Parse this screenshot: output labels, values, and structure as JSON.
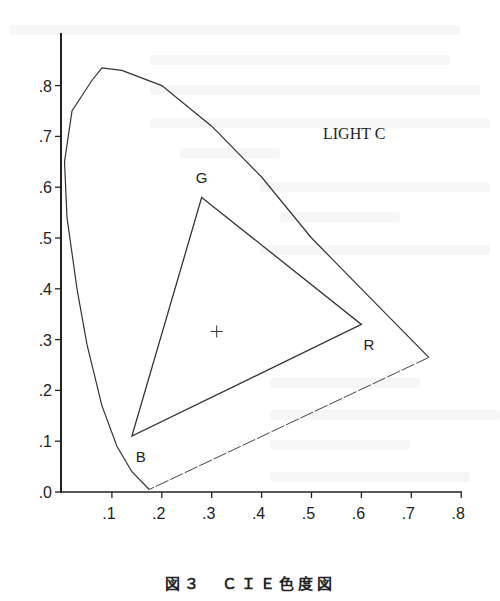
{
  "figure": {
    "caption": "図３　ＣＩＥ色度図",
    "annotation": "LIGHT C"
  },
  "chart_data": {
    "type": "scatter",
    "subtitle": "LIGHT C",
    "xlabel": "",
    "ylabel": "",
    "xlim": [
      0,
      0.8
    ],
    "ylim": [
      0,
      0.9
    ],
    "x_ticks": [
      ".1",
      ".2",
      ".3",
      ".4",
      ".5",
      ".6",
      ".7",
      ".8"
    ],
    "y_ticks": [
      ".0",
      ".1",
      ".2",
      ".3",
      ".4",
      ".5",
      ".6",
      ".7",
      ".8"
    ],
    "grid": false,
    "series": [
      {
        "name": "spectral locus",
        "style": "line",
        "points": [
          [
            0.175,
            0.005
          ],
          [
            0.14,
            0.04
          ],
          [
            0.11,
            0.09
          ],
          [
            0.08,
            0.17
          ],
          [
            0.05,
            0.29
          ],
          [
            0.03,
            0.4
          ],
          [
            0.01,
            0.54
          ],
          [
            0.005,
            0.65
          ],
          [
            0.02,
            0.75
          ],
          [
            0.06,
            0.81
          ],
          [
            0.08,
            0.835
          ],
          [
            0.12,
            0.83
          ],
          [
            0.2,
            0.8
          ],
          [
            0.3,
            0.72
          ],
          [
            0.4,
            0.62
          ],
          [
            0.5,
            0.5
          ],
          [
            0.6,
            0.4
          ],
          [
            0.735,
            0.265
          ]
        ]
      },
      {
        "name": "purple line",
        "style": "line",
        "points": [
          [
            0.735,
            0.265
          ],
          [
            0.175,
            0.005
          ]
        ]
      },
      {
        "name": "RGB gamut triangle",
        "style": "polygon",
        "points": [
          {
            "label": "G",
            "x": 0.28,
            "y": 0.58
          },
          {
            "label": "R",
            "x": 0.6,
            "y": 0.33
          },
          {
            "label": "B",
            "x": 0.14,
            "y": 0.11
          }
        ]
      },
      {
        "name": "white point (LIGHT C)",
        "style": "marker",
        "marker": "+",
        "points": [
          [
            0.31,
            0.316
          ]
        ]
      }
    ]
  }
}
